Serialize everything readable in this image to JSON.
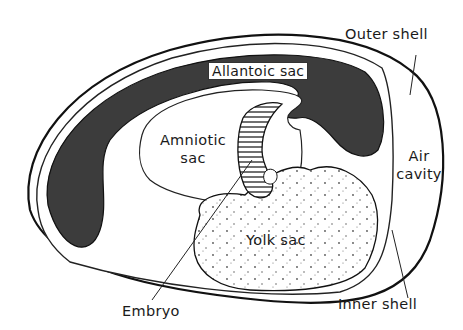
{
  "diagram": {
    "labels": {
      "outer_shell": "Outer shell",
      "allantoic_sac": "Allantoic sac",
      "amniotic_sac_line1": "Amniotic",
      "amniotic_sac_line2": "sac",
      "air_cavity_line1": "Air",
      "air_cavity_line2": "cavity",
      "yolk_sac": "Yolk sac",
      "embryo": "Embryo",
      "inner_shell": "Inner shell"
    },
    "colors": {
      "allantoic_fill": "#3c3c3c",
      "outline": "#111111",
      "background": "#ffffff",
      "yolk_dots": "#555555"
    }
  }
}
